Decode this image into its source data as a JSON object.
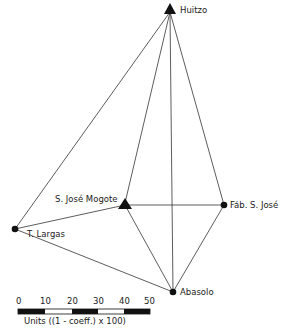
{
  "nodes": {
    "huitzo": {
      "label": "Huitzo",
      "shape": "triangle",
      "x": 170,
      "y": 10
    },
    "mogote": {
      "label": "S. José  Mogote",
      "shape": "triangle",
      "x": 125,
      "y": 205
    },
    "fab": {
      "label": "Fáb. S. José",
      "shape": "dot",
      "x": 224,
      "y": 205
    },
    "largas": {
      "label": "T. Largas",
      "shape": "dot",
      "x": 15,
      "y": 229
    },
    "abasolo": {
      "label": "Abasolo",
      "shape": "dot",
      "x": 173,
      "y": 292
    }
  },
  "edges": [
    [
      "huitzo",
      "largas"
    ],
    [
      "huitzo",
      "mogote"
    ],
    [
      "huitzo",
      "abasolo"
    ],
    [
      "huitzo",
      "fab"
    ],
    [
      "mogote",
      "fab"
    ],
    [
      "mogote",
      "abasolo"
    ],
    [
      "mogote",
      "largas"
    ],
    [
      "fab",
      "abasolo"
    ],
    [
      "largas",
      "abasolo"
    ]
  ],
  "scale": {
    "ticks": [
      "0",
      "10",
      "20",
      "30",
      "40",
      "50"
    ],
    "caption": "Units ((1 - coeff.) x 100)"
  }
}
